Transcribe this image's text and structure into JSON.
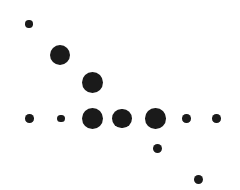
{
  "chart": {
    "title": "",
    "subtitle": "",
    "xlabel": "",
    "ylabel": "",
    "background_color": "#ffffff",
    "marker_color": "#1a1a1a",
    "width": 240,
    "height": 190
  },
  "chart_data": {
    "type": "scatter",
    "title": "",
    "xlabel": "",
    "ylabel": "",
    "grid": false,
    "legend": null,
    "axes_visible": false,
    "tick_labels_visible": false,
    "marker_color": "#1a1a1a",
    "background_color": "#ffffff",
    "xlim": [
      0,
      240
    ],
    "ylim": [
      0,
      190
    ],
    "note": "Pixel coordinates measured from the image; y increases downward. Marker radius encodes a third variable (bubble size).",
    "points": [
      {
        "id": "p1",
        "x": 29,
        "y": 24,
        "r": 3.7,
        "size_rank": 1
      },
      {
        "id": "p2",
        "x": 59.5,
        "y": 55,
        "r": 10.0,
        "size_rank": 4
      },
      {
        "id": "p3",
        "x": 92,
        "y": 82,
        "r": 10.5,
        "size_rank": 5
      },
      {
        "id": "p4",
        "x": 29.5,
        "y": 118.5,
        "r": 4.3,
        "size_rank": 2
      },
      {
        "id": "p5",
        "x": 61,
        "y": 118.5,
        "r": 3.7,
        "size_rank": 1
      },
      {
        "id": "p6",
        "x": 92.5,
        "y": 118.5,
        "r": 10.7,
        "size_rank": 6
      },
      {
        "id": "p7",
        "x": 122,
        "y": 118.3,
        "r": 9.7,
        "size_rank": 3
      },
      {
        "id": "p8",
        "x": 155.3,
        "y": 118.3,
        "r": 10.3,
        "size_rank": 5
      },
      {
        "id": "p9",
        "x": 186.7,
        "y": 118.5,
        "r": 4.3,
        "size_rank": 2
      },
      {
        "id": "p10",
        "x": 216.7,
        "y": 118.3,
        "r": 4.3,
        "size_rank": 2
      },
      {
        "id": "p11",
        "x": 157.3,
        "y": 148.7,
        "r": 4.7,
        "size_rank": 2
      },
      {
        "id": "p12",
        "x": 198.7,
        "y": 179.3,
        "r": 4.7,
        "size_rank": 2
      }
    ]
  }
}
